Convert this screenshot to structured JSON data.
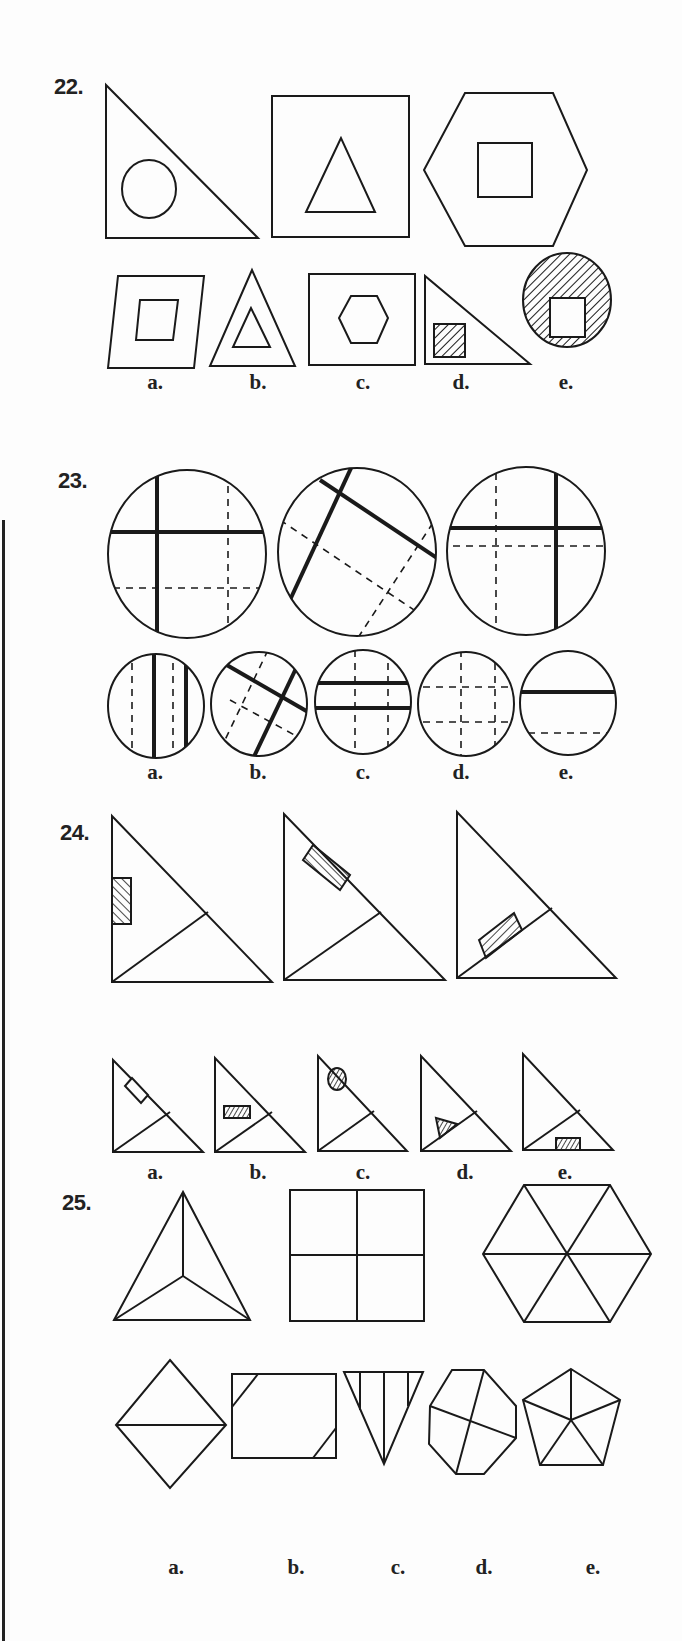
{
  "page": {
    "questions": [
      {
        "number": "22.",
        "prompt_figures": [
          "right-triangle-with-circle",
          "square-with-triangle",
          "hexagon-with-square"
        ],
        "options": [
          {
            "label": "a.",
            "figure": "parallelogram-with-parallelogram"
          },
          {
            "label": "b.",
            "figure": "triangle-with-triangle"
          },
          {
            "label": "c.",
            "figure": "square-with-hexagon"
          },
          {
            "label": "d.",
            "figure": "right-triangle-with-hatched-square"
          },
          {
            "label": "e.",
            "figure": "hatched-circle-with-square"
          }
        ]
      },
      {
        "number": "23.",
        "prompt_figures": [
          "circle-cross-lines-1",
          "circle-cross-lines-rotated",
          "circle-cross-lines-3"
        ],
        "options": [
          {
            "label": "a.",
            "figure": "circle-two-thick-vertical-two-dashed"
          },
          {
            "label": "b.",
            "figure": "circle-rotated-thick-cross-dashed"
          },
          {
            "label": "c.",
            "figure": "circle-two-thick-horizontal-two-dashed"
          },
          {
            "label": "d.",
            "figure": "circle-dashed-grid"
          },
          {
            "label": "e.",
            "figure": "circle-one-thick-one-dashed"
          }
        ]
      },
      {
        "number": "24.",
        "prompt_figures": [
          "triangle-hatched-rect-left",
          "triangle-hatched-rect-hyp",
          "triangle-hatched-rect-mid"
        ],
        "options": [
          {
            "label": "a.",
            "figure": "triangle-empty-rect-hyp"
          },
          {
            "label": "b.",
            "figure": "triangle-hatched-rect-mid"
          },
          {
            "label": "c.",
            "figure": "triangle-hatched-circle"
          },
          {
            "label": "d.",
            "figure": "triangle-hatched-triangle"
          },
          {
            "label": "e.",
            "figure": "triangle-hatched-rect-base"
          }
        ]
      },
      {
        "number": "25.",
        "prompt_figures": [
          "triangle-three-spokes",
          "square-four-quadrants",
          "hexagon-six-spokes"
        ],
        "options": [
          {
            "label": "a.",
            "figure": "diamond-split"
          },
          {
            "label": "b.",
            "figure": "rectangle-corner-cuts"
          },
          {
            "label": "c.",
            "figure": "inverted-triangle-stripes"
          },
          {
            "label": "d.",
            "figure": "octagon-cross"
          },
          {
            "label": "e.",
            "figure": "pentagon-five-spokes"
          }
        ]
      }
    ]
  }
}
